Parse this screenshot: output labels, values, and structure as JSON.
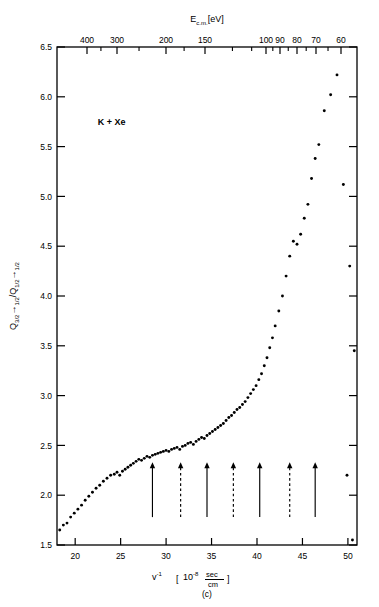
{
  "figure": {
    "panel_label": "(c)",
    "annotation": "K + Xe",
    "caption_partial": ""
  },
  "axes": {
    "top": {
      "title_main": "E",
      "title_sub": "c.m.",
      "title_unit": "[eV]",
      "title_full": "E c.m. [eV]",
      "labels": [
        "400",
        "300",
        "200",
        "150",
        "100",
        "90",
        "80",
        "70",
        "60"
      ],
      "label_values": [
        400,
        300,
        200,
        150,
        100,
        90,
        80,
        70,
        60
      ]
    },
    "bottom": {
      "title_var": "v",
      "title_exp": "-1",
      "title_bracket_open": "[",
      "title_factor": "10",
      "title_factor_exp": "-8",
      "title_num": "sec",
      "title_den": "cm",
      "title_bracket_close": "]",
      "title_full": "v^-1 [10^-8 sec/cm]",
      "labels": [
        "20",
        "25",
        "30",
        "35",
        "40",
        "45",
        "50"
      ],
      "label_values": [
        20,
        25,
        30,
        35,
        40,
        45,
        50
      ],
      "range": [
        18.0,
        51.0
      ]
    },
    "left": {
      "title_q1": "Q",
      "title_q1_sub": "3/2",
      "title_arrow": "→",
      "title_q1_sub2": "1/2",
      "title_slash": "/",
      "title_q2": "Q",
      "title_q2_sub": "1/2",
      "title_q2_sub2": "1/2",
      "title_full": "Q 3/2 → 1/2 / Q 1/2 → 1/2",
      "labels": [
        "1.5",
        "2.0",
        "2.5",
        "3.0",
        "3.5",
        "4.0",
        "4.5",
        "5.0",
        "5.5",
        "6.0",
        "6.5"
      ],
      "label_values": [
        1.5,
        2.0,
        2.5,
        3.0,
        3.5,
        4.0,
        4.5,
        5.0,
        5.5,
        6.0,
        6.5
      ],
      "range": [
        1.5,
        6.5
      ]
    }
  },
  "chart_data": {
    "type": "scatter",
    "title": "",
    "xlabel": "v^-1 [10^-8 sec/cm]",
    "ylabel": "Q 3/2 -> 1/2 / Q 1/2 -> 1/2",
    "x2label": "E c.m. [eV]",
    "xlim": [
      18.0,
      51.0
    ],
    "ylim": [
      1.5,
      6.5
    ],
    "grid": false,
    "legend": null,
    "annotations": [
      {
        "text": "K + Xe",
        "x": 24.0,
        "y": 5.72
      }
    ],
    "series": [
      {
        "name": "Q3/2->1/2 / Q1/2->1/2 ratio",
        "marker": "dot",
        "color": "#000000",
        "x": [
          18.3,
          18.7,
          19.1,
          19.5,
          19.9,
          20.3,
          20.7,
          21.1,
          21.5,
          21.9,
          22.3,
          22.7,
          23.1,
          23.5,
          23.9,
          24.3,
          24.6,
          24.9,
          25.2,
          25.5,
          25.8,
          26.1,
          26.4,
          26.7,
          27.0,
          27.3,
          27.6,
          27.9,
          28.2,
          28.5,
          28.8,
          29.1,
          29.4,
          29.7,
          30.0,
          30.3,
          30.6,
          30.9,
          31.2,
          31.5,
          31.8,
          32.1,
          32.4,
          32.7,
          33.0,
          33.3,
          33.6,
          33.9,
          34.2,
          34.5,
          34.8,
          35.1,
          35.4,
          35.7,
          36.0,
          36.3,
          36.6,
          36.9,
          37.2,
          37.5,
          37.8,
          38.1,
          38.4,
          38.7,
          39.0,
          39.3,
          39.6,
          39.9,
          40.2,
          40.5,
          40.8,
          41.1,
          41.4,
          41.7,
          42.0,
          42.4,
          42.8,
          43.2,
          43.6,
          44.0,
          44.4,
          44.8,
          45.2,
          45.6,
          46.0,
          46.4,
          46.8,
          47.4,
          48.1,
          48.8,
          49.5,
          50.2,
          50.7
        ],
        "y": [
          1.65,
          1.7,
          1.72,
          1.78,
          1.82,
          1.86,
          1.9,
          1.95,
          1.99,
          2.03,
          2.07,
          2.1,
          2.14,
          2.17,
          2.2,
          2.21,
          2.23,
          2.2,
          2.24,
          2.26,
          2.28,
          2.3,
          2.32,
          2.34,
          2.36,
          2.35,
          2.37,
          2.39,
          2.38,
          2.4,
          2.41,
          2.42,
          2.43,
          2.44,
          2.45,
          2.44,
          2.46,
          2.47,
          2.48,
          2.46,
          2.49,
          2.5,
          2.52,
          2.53,
          2.51,
          2.54,
          2.56,
          2.58,
          2.57,
          2.6,
          2.62,
          2.64,
          2.66,
          2.68,
          2.7,
          2.72,
          2.75,
          2.78,
          2.8,
          2.83,
          2.86,
          2.88,
          2.91,
          2.94,
          2.98,
          3.02,
          3.06,
          3.1,
          3.16,
          3.22,
          3.3,
          3.38,
          3.48,
          3.58,
          3.7,
          3.85,
          4.0,
          4.2,
          4.4,
          4.55,
          4.52,
          4.62,
          4.78,
          4.92,
          5.18,
          5.38,
          5.52,
          5.86,
          6.02,
          6.22,
          5.12,
          4.3,
          3.45
        ]
      },
      {
        "name": "outlier tail",
        "marker": "dot",
        "color": "#000000",
        "x": [
          49.9,
          50.5
        ],
        "y": [
          2.2,
          1.55
        ]
      }
    ],
    "arrows": [
      {
        "x": 28.5,
        "style": "solid",
        "y_tip": 2.33,
        "y_tail": 1.78
      },
      {
        "x": 31.6,
        "style": "dashed",
        "y_tip": 2.33,
        "y_tail": 1.78
      },
      {
        "x": 34.5,
        "style": "solid",
        "y_tip": 2.33,
        "y_tail": 1.78
      },
      {
        "x": 37.4,
        "style": "dashed",
        "y_tip": 2.33,
        "y_tail": 1.78
      },
      {
        "x": 40.3,
        "style": "solid",
        "y_tip": 2.33,
        "y_tail": 1.78
      },
      {
        "x": 43.6,
        "style": "dashed",
        "y_tip": 2.33,
        "y_tail": 1.78
      },
      {
        "x": 46.4,
        "style": "solid",
        "y_tip": 2.33,
        "y_tail": 1.78
      }
    ]
  }
}
